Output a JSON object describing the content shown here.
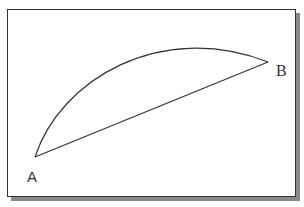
{
  "diagram": {
    "points": {
      "A": {
        "label": "A",
        "x": 35,
        "y": 157
      },
      "B": {
        "label": "B",
        "x": 268,
        "y": 62
      }
    },
    "arc": {
      "from": "A",
      "to": "B",
      "type": "curve"
    },
    "chord": {
      "from": "A",
      "to": "B",
      "type": "straight-line"
    },
    "colors": {
      "stroke": "#333333",
      "frame_border": "#333333",
      "shadow": "#8a8a8a",
      "background": "#ffffff"
    }
  }
}
